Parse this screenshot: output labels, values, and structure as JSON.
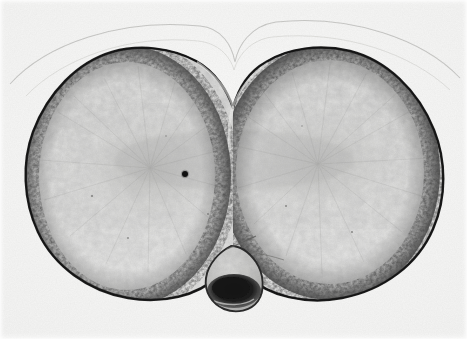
{
  "figure": {
    "kind": "light-microscope-photomicrograph",
    "caption_text": "",
    "has_visible_text": false,
    "has_scale_bar": false,
    "has_labels": false,
    "width_px": 467,
    "height_px": 339,
    "orientation": "landscape"
  },
  "palette": {
    "print_background": "#f3f3f2",
    "print_margin_highlight": "#fbfbfa",
    "cortex_dark": "#222222",
    "cortex_mid": "#4a4a4a",
    "cytoplasm_light": "#e3e3e1",
    "cytoplasm_vacuole_highlight": "#f1f1ef",
    "cytoplasm_reticulum": "#9a9a98",
    "central_zone_grey": "#c4c4c2",
    "polar_body_core": "#1c1c1c",
    "envelope_line": "#b9b9b7",
    "nucleolus_dot": "#121212"
  },
  "structures": {
    "left_blastomere": {
      "name": "left blastomere",
      "center_x": 127,
      "center_y": 176,
      "radius_x": 100,
      "radius_y": 126
    },
    "right_blastomere": {
      "name": "right blastomere",
      "center_x": 330,
      "center_y": 172,
      "radius_x": 106,
      "radius_y": 124
    },
    "cleavage_furrow": {
      "name": "cleavage furrow",
      "apex_x": 233,
      "apex_y": 108,
      "position": "top-center"
    },
    "polar_body": {
      "name": "polar body",
      "center_x": 232,
      "center_y": 277,
      "width": 52,
      "height": 62,
      "position": "bottom-center"
    },
    "dark_dot": {
      "name": "dense cytoplasmic granule",
      "x": 185,
      "y": 174,
      "diameter": 6
    },
    "vitelline_envelope": {
      "name": "vitelline envelope",
      "visible": true,
      "description": "faint thin arc above both blastomeres dipping at the furrow"
    },
    "filament": {
      "name": "thin filament",
      "description": "fine diagonal strand running up-right from the polar body"
    }
  }
}
